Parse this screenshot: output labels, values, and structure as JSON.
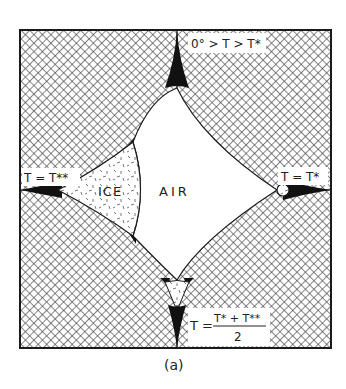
{
  "figure": {
    "caption": "(a)",
    "colors": {
      "ink": "#1a1a1a",
      "background": "#ffffff",
      "hatch": "#3a3a3a"
    },
    "regions": {
      "air_label": "AIR",
      "ice_label": "ICE"
    },
    "annotations": {
      "top": "0° > T > T*",
      "left": "T = T**",
      "right": "T = T*",
      "bottom_lhs": "T =",
      "bottom_numerator": "T* + T**",
      "bottom_denominator": "2"
    },
    "legend_fills": [
      {
        "name": "grain-hatch",
        "description": "cross-hatched solid grains"
      },
      {
        "name": "ice-stipple",
        "description": "stippled ice"
      },
      {
        "name": "air-blank",
        "description": "white air pore"
      },
      {
        "name": "liquid-black",
        "description": "black liquid at grain boundary cusps"
      }
    ]
  }
}
